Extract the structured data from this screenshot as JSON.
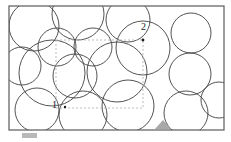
{
  "figure": {
    "background_color": "#ffffff",
    "container": {
      "name": "outer-rectangle",
      "x": 9,
      "y": 6,
      "width": 215,
      "height": 124,
      "stroke_color": "#5a5a5a",
      "stroke_width": 1.2,
      "fill": "none"
    },
    "roi": {
      "name": "dashed-region-of-interest",
      "x": 56,
      "y": 40,
      "width": 87,
      "height": 68,
      "stroke_color": "#bdbdbd",
      "stroke_width": 1,
      "dash_pattern": "2 2",
      "fill": "none"
    },
    "markers": [
      {
        "label": "1",
        "label_x": 52,
        "label_y": 100,
        "dot_x": 65,
        "dot_y": 107,
        "dot_r": 1.2,
        "color": "#1a1a1a"
      },
      {
        "label": "2",
        "label_x": 141,
        "label_y": 22,
        "dot_x": 143,
        "dot_y": 40,
        "dot_r": 1.4,
        "color": "#1a1a1a"
      }
    ],
    "shaded_triangle": {
      "name": "shaded-contact-triangle",
      "points": "155,129 171,129 163,120",
      "fill": "#a8a8a8",
      "stroke": "none"
    },
    "scale_bar": {
      "name": "scale-bar",
      "x": 22,
      "y": 133,
      "width": 15,
      "height": 5,
      "color": "#b9b9b9"
    },
    "circle_style": {
      "stroke_color": "#3f3f3f",
      "stroke_width": 0.9,
      "fill": "none"
    },
    "circles": [
      {
        "id": "c01",
        "cx": 34,
        "cy": 26,
        "r": 25
      },
      {
        "id": "c02",
        "cx": 78,
        "cy": 14,
        "r": 26
      },
      {
        "id": "c03",
        "cx": 128,
        "cy": 20,
        "r": 22
      },
      {
        "id": "c04",
        "cx": 143,
        "cy": 48,
        "r": 27
      },
      {
        "id": "c05",
        "cx": 191,
        "cy": 33,
        "r": 20
      },
      {
        "id": "c06",
        "cx": 57,
        "cy": 47,
        "r": 19
      },
      {
        "id": "c07",
        "cx": 93,
        "cy": 47,
        "r": 19
      },
      {
        "id": "c08",
        "cx": 22,
        "cy": 66,
        "r": 19
      },
      {
        "id": "c09",
        "cx": 75,
        "cy": 76,
        "r": 22
      },
      {
        "id": "c10",
        "cx": 117,
        "cy": 72,
        "r": 30
      },
      {
        "id": "c11",
        "cx": 190,
        "cy": 74,
        "r": 21
      },
      {
        "id": "c12",
        "cx": 37,
        "cy": 110,
        "r": 22
      },
      {
        "id": "c13",
        "cx": 83,
        "cy": 115,
        "r": 24
      },
      {
        "id": "c14",
        "cx": 128,
        "cy": 106,
        "r": 26
      },
      {
        "id": "c15",
        "cx": 186,
        "cy": 113,
        "r": 22
      },
      {
        "id": "c16",
        "cx": 52,
        "cy": 73,
        "r": 33
      },
      {
        "id": "c17",
        "cx": 219,
        "cy": 100,
        "r": 18
      }
    ]
  }
}
